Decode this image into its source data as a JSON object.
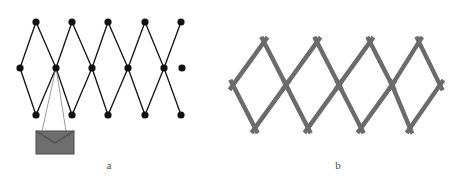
{
  "figure": {
    "width": 466,
    "height": 183,
    "background": "#ffffff",
    "panels": [
      {
        "id": "a",
        "caption": "a",
        "caption_x": 109,
        "caption_y": 165,
        "style": "node-link graph with filled round joints and thin black bars",
        "node_color": "#111111",
        "edge_color": "#111111",
        "edge_width": 1.3,
        "node_radius": 3.6,
        "rows": {
          "top_y": 22,
          "middle_y": 68,
          "bottom_y": 115
        },
        "nodes_top": [
          {
            "x": 36,
            "y": 22
          },
          {
            "x": 72,
            "y": 22
          },
          {
            "x": 108,
            "y": 22
          },
          {
            "x": 145,
            "y": 22
          },
          {
            "x": 181,
            "y": 22
          }
        ],
        "nodes_middle": [
          {
            "x": 20,
            "y": 68
          },
          {
            "x": 56,
            "y": 68
          },
          {
            "x": 92,
            "y": 68
          },
          {
            "x": 128,
            "y": 68
          },
          {
            "x": 164,
            "y": 68
          },
          {
            "x": 182,
            "y": 68
          }
        ],
        "nodes_bottom": [
          {
            "x": 36,
            "y": 115
          },
          {
            "x": 72,
            "y": 115
          },
          {
            "x": 108,
            "y": 115
          },
          {
            "x": 145,
            "y": 115
          },
          {
            "x": 181,
            "y": 115
          }
        ],
        "payload": {
          "type": "envelope",
          "label": "envelope-payload",
          "x": 36,
          "y": 131,
          "width": 38,
          "height": 23,
          "fill": "#6e6e6e",
          "stroke": "#4a4a4a",
          "flap_color": "#555555",
          "suspension_lines": [
            {
              "x1": 56,
              "y1": 68,
              "x2": 42,
              "y2": 131
            },
            {
              "x1": 56,
              "y1": 68,
              "x2": 66,
              "y2": 131
            }
          ],
          "suspension_color": "#9a9a9a",
          "suspension_width": 1.0
        }
      },
      {
        "id": "b",
        "caption": "b",
        "caption_x": 338,
        "caption_y": 165,
        "style": "thick gray scissor bars crossing in X joints, no drawn nodes",
        "bar_color": "#6b6b6b",
        "bar_width": 4.4,
        "overhang": 6,
        "rows": {
          "top_y": 42,
          "middle_y": 85,
          "bottom_y": 128
        },
        "nodes_top": [
          {
            "x": 264,
            "y": 42
          },
          {
            "x": 317,
            "y": 42
          },
          {
            "x": 370,
            "y": 42
          },
          {
            "x": 419,
            "y": 42
          }
        ],
        "nodes_middle": [
          {
            "x": 233,
            "y": 85
          },
          {
            "x": 286,
            "y": 85
          },
          {
            "x": 339,
            "y": 85
          },
          {
            "x": 392,
            "y": 85
          },
          {
            "x": 440,
            "y": 85
          }
        ],
        "nodes_bottom": [
          {
            "x": 255,
            "y": 128
          },
          {
            "x": 308,
            "y": 128
          },
          {
            "x": 361,
            "y": 128
          },
          {
            "x": 410,
            "y": 128
          }
        ]
      }
    ]
  }
}
